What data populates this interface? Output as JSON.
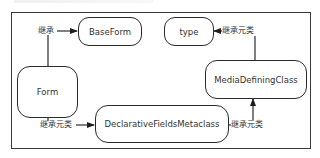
{
  "diagram": {
    "type": "class-inheritance",
    "nodes": [
      {
        "id": "baseform",
        "label": "BaseForm"
      },
      {
        "id": "type",
        "label": "type"
      },
      {
        "id": "form",
        "label": "Form"
      },
      {
        "id": "mediadefining",
        "label": "MediaDefiningClass"
      },
      {
        "id": "declarative",
        "label": "DeclarativeFieldsMetaclass"
      }
    ],
    "edges": [
      {
        "from": "form",
        "to": "baseform",
        "label": "继承"
      },
      {
        "from": "mediadefining",
        "to": "type",
        "label": "继承元类"
      },
      {
        "from": "form",
        "to": "declarative",
        "label": "继承元类"
      },
      {
        "from": "declarative",
        "to": "mediadefining",
        "label": "继承元类"
      }
    ]
  },
  "colors": {
    "stroke": "#2a2a2a",
    "text": "#333333",
    "background": "#ffffff"
  }
}
